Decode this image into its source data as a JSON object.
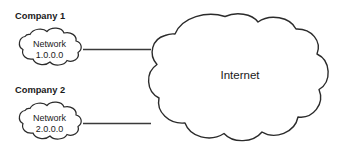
{
  "diagram": {
    "background_color": "#ffffff",
    "stroke_color": "#2b2b2b",
    "text_color": "#1a1a1a",
    "nodes": [
      {
        "id": "company-1",
        "label": "Company 1",
        "cloud_line_1": "Network",
        "cloud_line_2": "1.0.0.0",
        "shape": "cloud"
      },
      {
        "id": "company-2",
        "label": "Company 2",
        "cloud_line_1": "Network",
        "cloud_line_2": "2.0.0.0",
        "shape": "cloud"
      },
      {
        "id": "internet",
        "label": "Internet",
        "shape": "cloud"
      }
    ],
    "connections": [
      {
        "from": "company-1",
        "to": "internet",
        "style": "solid-line"
      },
      {
        "from": "company-2",
        "to": "internet",
        "style": "solid-line"
      }
    ]
  }
}
